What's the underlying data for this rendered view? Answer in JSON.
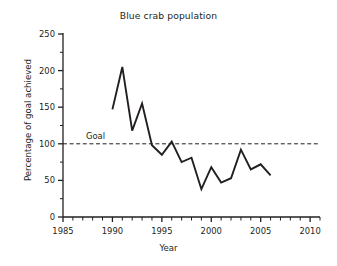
{
  "chart_data": {
    "type": "line",
    "title": "Blue crab population",
    "xlabel": "Year",
    "ylabel": "Percentage of goal achieved",
    "x": [
      1990,
      1991,
      1992,
      1993,
      1994,
      1995,
      1996,
      1997,
      1998,
      1999,
      2000,
      2001,
      2002,
      2003,
      2004,
      2005,
      2006
    ],
    "values": [
      147,
      205,
      118,
      155,
      98,
      85,
      103,
      75,
      81,
      38,
      68,
      47,
      53,
      92,
      65,
      72,
      57
    ],
    "series": [
      {
        "name": "Percentage of goal achieved",
        "values": [
          147,
          205,
          118,
          155,
          98,
          85,
          103,
          75,
          81,
          38,
          68,
          47,
          53,
          92,
          65,
          72,
          57
        ]
      }
    ],
    "xlim": [
      1985,
      2011
    ],
    "ylim": [
      0,
      250
    ],
    "xticks": [
      1985,
      1990,
      1995,
      2000,
      2005,
      2010
    ],
    "yticks": [
      0,
      50,
      100,
      150,
      200,
      250
    ],
    "xtick_labels": [
      "1985",
      "1990",
      "1995",
      "2000",
      "2005",
      "2010"
    ],
    "ytick_labels": [
      "0",
      "50",
      "100",
      "150",
      "200",
      "250"
    ],
    "minor_xtick_interval": 1,
    "minor_ytick_interval": 25,
    "grid": false,
    "legend": "none",
    "annotations": [
      {
        "name": "goal-line",
        "label": "Goal",
        "y": 100,
        "style": "dashed horizontal reference line"
      }
    ],
    "colors": {
      "line": "#231f20",
      "goal_line": "#231f20",
      "axis": "#231f20",
      "background": "#ffffff",
      "text": "#231f20"
    }
  }
}
